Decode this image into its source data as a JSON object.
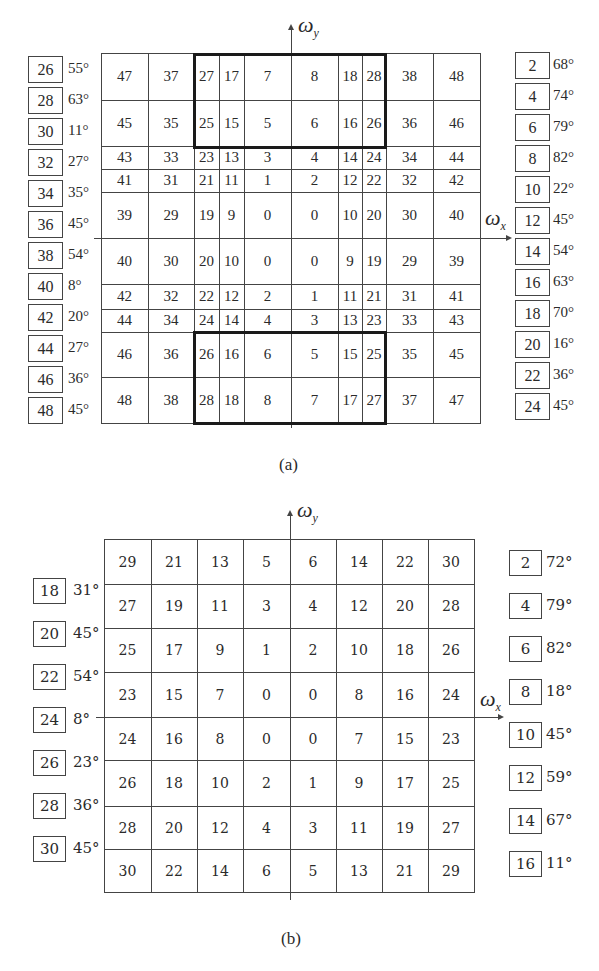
{
  "figure_a": {
    "caption": "(a)",
    "axis_y": "ω",
    "axis_y_sub": "y",
    "axis_x": "ω",
    "axis_x_sub": "x",
    "grid": [
      [
        "47",
        "37",
        "27",
        "17",
        "7",
        "8",
        "18",
        "28",
        "38",
        "48"
      ],
      [
        "45",
        "35",
        "25",
        "15",
        "5",
        "6",
        "16",
        "26",
        "36",
        "46"
      ],
      [
        "43",
        "33",
        "23",
        "13",
        "3",
        "4",
        "14",
        "24",
        "34",
        "44"
      ],
      [
        "41",
        "31",
        "21",
        "11",
        "1",
        "2",
        "12",
        "22",
        "32",
        "42"
      ],
      [
        "39",
        "29",
        "19",
        "9",
        "0",
        "0",
        "10",
        "20",
        "30",
        "40"
      ],
      [
        "40",
        "30",
        "20",
        "10",
        "0",
        "0",
        "9",
        "19",
        "29",
        "39"
      ],
      [
        "42",
        "32",
        "22",
        "12",
        "2",
        "1",
        "11",
        "21",
        "31",
        "41"
      ],
      [
        "44",
        "34",
        "24",
        "14",
        "4",
        "3",
        "13",
        "23",
        "33",
        "43"
      ],
      [
        "46",
        "36",
        "26",
        "16",
        "6",
        "5",
        "15",
        "25",
        "35",
        "45"
      ],
      [
        "48",
        "38",
        "28",
        "18",
        "8",
        "7",
        "17",
        "27",
        "37",
        "47"
      ]
    ],
    "left_legend": [
      {
        "id": "26",
        "angle": "55°"
      },
      {
        "id": "28",
        "angle": "63°"
      },
      {
        "id": "30",
        "angle": "11°"
      },
      {
        "id": "32",
        "angle": "27°"
      },
      {
        "id": "34",
        "angle": "35°"
      },
      {
        "id": "36",
        "angle": "45°"
      },
      {
        "id": "38",
        "angle": "54°"
      },
      {
        "id": "40",
        "angle": "8°"
      },
      {
        "id": "42",
        "angle": "20°"
      },
      {
        "id": "44",
        "angle": "27°"
      },
      {
        "id": "46",
        "angle": "36°"
      },
      {
        "id": "48",
        "angle": "45°"
      }
    ],
    "right_legend": [
      {
        "id": "2",
        "angle": "68°"
      },
      {
        "id": "4",
        "angle": "74°"
      },
      {
        "id": "6",
        "angle": "79°"
      },
      {
        "id": "8",
        "angle": "82°"
      },
      {
        "id": "10",
        "angle": "22°"
      },
      {
        "id": "12",
        "angle": "45°"
      },
      {
        "id": "14",
        "angle": "54°"
      },
      {
        "id": "16",
        "angle": "63°"
      },
      {
        "id": "18",
        "angle": "70°"
      },
      {
        "id": "20",
        "angle": "16°"
      },
      {
        "id": "22",
        "angle": "36°"
      },
      {
        "id": "24",
        "angle": "45°"
      }
    ]
  },
  "figure_b": {
    "caption": "(b)",
    "axis_y": "ω",
    "axis_y_sub": "y",
    "axis_x": "ω",
    "axis_x_sub": "x",
    "grid": [
      [
        "29",
        "21",
        "13",
        "5",
        "6",
        "14",
        "22",
        "30"
      ],
      [
        "27",
        "19",
        "11",
        "3",
        "4",
        "12",
        "20",
        "28"
      ],
      [
        "25",
        "17",
        "9",
        "1",
        "2",
        "10",
        "18",
        "26"
      ],
      [
        "23",
        "15",
        "7",
        "0",
        "0",
        "8",
        "16",
        "24"
      ],
      [
        "24",
        "16",
        "8",
        "0",
        "0",
        "7",
        "15",
        "23"
      ],
      [
        "26",
        "18",
        "10",
        "2",
        "1",
        "9",
        "17",
        "25"
      ],
      [
        "28",
        "20",
        "12",
        "4",
        "3",
        "11",
        "19",
        "27"
      ],
      [
        "30",
        "22",
        "14",
        "6",
        "5",
        "13",
        "21",
        "29"
      ]
    ],
    "left_legend": [
      {
        "id": "18",
        "angle": "31°"
      },
      {
        "id": "20",
        "angle": "45°"
      },
      {
        "id": "22",
        "angle": "54°"
      },
      {
        "id": "24",
        "angle": "8°"
      },
      {
        "id": "26",
        "angle": "23°"
      },
      {
        "id": "28",
        "angle": "36°"
      },
      {
        "id": "30",
        "angle": "45°"
      }
    ],
    "right_legend": [
      {
        "id": "2",
        "angle": "72°"
      },
      {
        "id": "4",
        "angle": "79°"
      },
      {
        "id": "6",
        "angle": "82°"
      },
      {
        "id": "8",
        "angle": "18°"
      },
      {
        "id": "10",
        "angle": "45°"
      },
      {
        "id": "12",
        "angle": "59°"
      },
      {
        "id": "14",
        "angle": "67°"
      },
      {
        "id": "16",
        "angle": "11°"
      }
    ]
  }
}
